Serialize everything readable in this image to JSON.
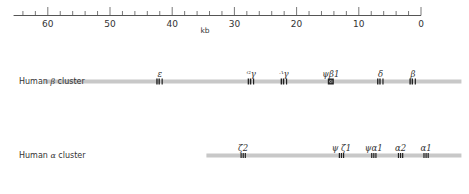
{
  "scale": {
    "unit_label": "kb",
    "ticks_major": [
      60,
      50,
      40,
      30,
      20,
      10,
      0
    ],
    "ticks_minor_step": 2,
    "range_kb": [
      65.5,
      0
    ]
  },
  "clusters": [
    {
      "name": "Human β cluster",
      "label_prefix": "Human ",
      "label_greek": "β",
      "label_suffix": " cluster",
      "bar_start_kb": 60.5,
      "bar_end_kb": -6.5,
      "genes": [
        {
          "label": "ε",
          "pos_kb": 42.0,
          "type": "gene"
        },
        {
          "label": "ᴳγ",
          "pos_kb": 27.3,
          "type": "gene"
        },
        {
          "label": "ᴬγ",
          "pos_kb": 22.0,
          "type": "gene"
        },
        {
          "label": "ψβ1",
          "pos_kb": 14.5,
          "type": "pseudogene"
        },
        {
          "label": "δ",
          "pos_kb": 6.5,
          "type": "gene"
        },
        {
          "label": "β",
          "pos_kb": 1.3,
          "type": "gene"
        }
      ]
    },
    {
      "name": "Human α cluster",
      "label_prefix": "Human ",
      "label_greek": "α",
      "label_suffix": " cluster",
      "bar_start_kb": 34.5,
      "bar_end_kb": -6.5,
      "genes": [
        {
          "label": "ζ2",
          "pos_kb": 28.6,
          "type": "gene3"
        },
        {
          "label": "ψ ζ1",
          "pos_kb": 12.8,
          "type": "gene3"
        },
        {
          "label": "ψα1",
          "pos_kb": 7.6,
          "type": "gene3"
        },
        {
          "label": "α2",
          "pos_kb": 3.3,
          "type": "gene3"
        },
        {
          "label": "α1",
          "pos_kb": -0.8,
          "type": "gene3"
        }
      ]
    }
  ],
  "colors": {
    "axis": "#555555",
    "bar": "#c8c8c8",
    "gene": "#222222",
    "text": "#333333"
  }
}
